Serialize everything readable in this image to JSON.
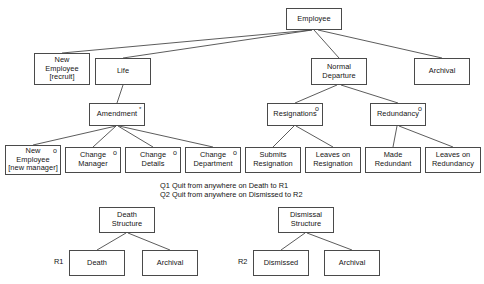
{
  "diagram": {
    "background_color": "#ffffff",
    "line_color": "#4a4a4a",
    "text_color": "#141414",
    "nodes": [
      {
        "id": "employee",
        "label": "Employee",
        "marker": "",
        "x": 286,
        "y": 8,
        "w": 56,
        "h": 22
      },
      {
        "id": "new-employee-recruit",
        "label": "New\nEmployee\n[recruit]",
        "marker": "",
        "x": 34,
        "y": 53,
        "w": 56,
        "h": 32
      },
      {
        "id": "life",
        "label": "Life",
        "marker": "",
        "x": 95,
        "y": 58,
        "w": 56,
        "h": 27
      },
      {
        "id": "normal-departure",
        "label": "Normal\nDeparture",
        "marker": "",
        "x": 311,
        "y": 58,
        "w": 56,
        "h": 27
      },
      {
        "id": "archival-top",
        "label": "Archival",
        "marker": "",
        "x": 414,
        "y": 58,
        "w": 56,
        "h": 27
      },
      {
        "id": "amendment",
        "label": "Amendment",
        "marker": "*",
        "x": 89,
        "y": 103,
        "w": 56,
        "h": 23
      },
      {
        "id": "resignations",
        "label": "Resignations",
        "marker": "o",
        "x": 267,
        "y": 103,
        "w": 56,
        "h": 23
      },
      {
        "id": "redundancy",
        "label": "Redundancy",
        "marker": "o",
        "x": 370,
        "y": 103,
        "w": 56,
        "h": 23
      },
      {
        "id": "new-employee-manager",
        "label": "New\nEmployee\n[new manager]",
        "marker": "o",
        "x": 5,
        "y": 145,
        "w": 56,
        "h": 30
      },
      {
        "id": "change-manager",
        "label": "Change\nManager",
        "marker": "o",
        "x": 65,
        "y": 147,
        "w": 56,
        "h": 26
      },
      {
        "id": "change-details",
        "label": "Change\nDetails",
        "marker": "o",
        "x": 125,
        "y": 147,
        "w": 56,
        "h": 26
      },
      {
        "id": "change-department",
        "label": "Change\nDepartment",
        "marker": "o",
        "x": 185,
        "y": 147,
        "w": 56,
        "h": 26
      },
      {
        "id": "submits-resignation",
        "label": "Submits\nResignation",
        "marker": "",
        "x": 245,
        "y": 147,
        "w": 56,
        "h": 26
      },
      {
        "id": "leaves-on-resignation",
        "label": "Leaves on\nResignation",
        "marker": "",
        "x": 305,
        "y": 147,
        "w": 56,
        "h": 26
      },
      {
        "id": "made-redundant",
        "label": "Made\nRedundant",
        "marker": "",
        "x": 365,
        "y": 147,
        "w": 56,
        "h": 26
      },
      {
        "id": "leaves-on-redundancy",
        "label": "Leaves on\nRedundancy",
        "marker": "",
        "x": 425,
        "y": 147,
        "w": 56,
        "h": 26
      },
      {
        "id": "death-structure",
        "label": "Death\nStructure",
        "marker": "",
        "x": 99,
        "y": 207,
        "w": 56,
        "h": 26
      },
      {
        "id": "death",
        "label": "Death",
        "marker": "",
        "x": 69,
        "y": 250,
        "w": 56,
        "h": 26
      },
      {
        "id": "archival-death",
        "label": "Archival",
        "marker": "",
        "x": 142,
        "y": 250,
        "w": 56,
        "h": 26
      },
      {
        "id": "dismissal-structure",
        "label": "Dismissal\nStructure",
        "marker": "",
        "x": 278,
        "y": 207,
        "w": 56,
        "h": 26
      },
      {
        "id": "dismissed",
        "label": "Dismissed",
        "marker": "",
        "x": 253,
        "y": 250,
        "w": 56,
        "h": 26
      },
      {
        "id": "archival-dismissal",
        "label": "Archival",
        "marker": "",
        "x": 324,
        "y": 250,
        "w": 56,
        "h": 26
      }
    ],
    "edges": [
      {
        "from": "employee",
        "to": "new-employee-recruit",
        "x1": 312,
        "y1": 30,
        "x2": 62,
        "y2": 53
      },
      {
        "from": "employee",
        "to": "life",
        "x1": 312,
        "y1": 30,
        "x2": 123,
        "y2": 58
      },
      {
        "from": "employee",
        "to": "normal-departure",
        "x1": 314,
        "y1": 30,
        "x2": 339,
        "y2": 58
      },
      {
        "from": "employee",
        "to": "archival-top",
        "x1": 318,
        "y1": 30,
        "x2": 442,
        "y2": 58
      },
      {
        "from": "life",
        "to": "amendment",
        "x1": 123,
        "y1": 85,
        "x2": 117,
        "y2": 103
      },
      {
        "from": "normal-departure",
        "to": "resignations",
        "x1": 337,
        "y1": 85,
        "x2": 295,
        "y2": 103
      },
      {
        "from": "normal-departure",
        "to": "redundancy",
        "x1": 341,
        "y1": 85,
        "x2": 398,
        "y2": 103
      },
      {
        "from": "amendment",
        "to": "new-employee-manager",
        "x1": 116,
        "y1": 126,
        "x2": 33,
        "y2": 145
      },
      {
        "from": "amendment",
        "to": "change-manager",
        "x1": 116,
        "y1": 126,
        "x2": 93,
        "y2": 147
      },
      {
        "from": "amendment",
        "to": "change-details",
        "x1": 118,
        "y1": 126,
        "x2": 153,
        "y2": 147
      },
      {
        "from": "amendment",
        "to": "change-department",
        "x1": 119,
        "y1": 126,
        "x2": 213,
        "y2": 147
      },
      {
        "from": "resignations",
        "to": "submits-resignation",
        "x1": 294,
        "y1": 126,
        "x2": 273,
        "y2": 147
      },
      {
        "from": "resignations",
        "to": "leaves-on-resignation",
        "x1": 296,
        "y1": 126,
        "x2": 333,
        "y2": 147
      },
      {
        "from": "redundancy",
        "to": "made-redundant",
        "x1": 397,
        "y1": 126,
        "x2": 393,
        "y2": 147
      },
      {
        "from": "redundancy",
        "to": "leaves-on-redundancy",
        "x1": 399,
        "y1": 126,
        "x2": 453,
        "y2": 147
      },
      {
        "from": "death-structure",
        "to": "death",
        "x1": 126,
        "y1": 233,
        "x2": 97,
        "y2": 250
      },
      {
        "from": "death-structure",
        "to": "archival-death",
        "x1": 128,
        "y1": 233,
        "x2": 170,
        "y2": 250
      },
      {
        "from": "dismissal-structure",
        "to": "dismissed",
        "x1": 305,
        "y1": 233,
        "x2": 281,
        "y2": 250
      },
      {
        "from": "dismissal-structure",
        "to": "archival-dismissal",
        "x1": 307,
        "y1": 233,
        "x2": 352,
        "y2": 250
      }
    ],
    "notes": [
      {
        "id": "note-q1",
        "text": "Q1 Quit from anywhere on Death to R1",
        "x": 160,
        "y": 181
      },
      {
        "id": "note-q2",
        "text": "Q2 Quit from anywhere on Dismissed to R2",
        "x": 160,
        "y": 190
      }
    ],
    "side_labels": [
      {
        "id": "label-r1",
        "text": "R1",
        "x": 54,
        "y": 258
      },
      {
        "id": "label-r2",
        "text": "R2",
        "x": 238,
        "y": 258
      }
    ]
  }
}
